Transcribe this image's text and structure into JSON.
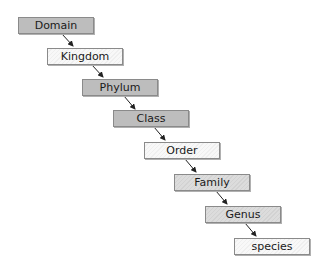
{
  "diagram": {
    "type": "taxonomic-hierarchy",
    "nodes": [
      {
        "id": "domain",
        "label": "Domain",
        "shade": "dark"
      },
      {
        "id": "kingdom",
        "label": "Kingdom",
        "shade": "light"
      },
      {
        "id": "phylum",
        "label": "Phylum",
        "shade": "dark"
      },
      {
        "id": "class",
        "label": "Class",
        "shade": "dark"
      },
      {
        "id": "order",
        "label": "Order",
        "shade": "light"
      },
      {
        "id": "family",
        "label": "Family",
        "shade": "mid"
      },
      {
        "id": "genus",
        "label": "Genus",
        "shade": "mid"
      },
      {
        "id": "species",
        "label": "species",
        "shade": "light"
      }
    ],
    "edges": [
      [
        "domain",
        "kingdom"
      ],
      [
        "kingdom",
        "phylum"
      ],
      [
        "phylum",
        "class"
      ],
      [
        "class",
        "order"
      ],
      [
        "order",
        "family"
      ],
      [
        "family",
        "genus"
      ],
      [
        "genus",
        "species"
      ]
    ]
  }
}
